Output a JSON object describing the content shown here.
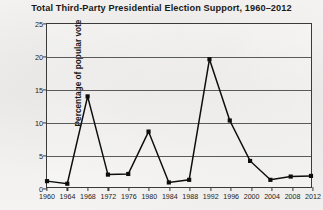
{
  "chart_data": {
    "type": "line",
    "title": "Total Third-Party Presidential Election Support, 1960–2012",
    "xlabel": "",
    "ylabel": "Percentage of popular vote",
    "x": [
      1960,
      1964,
      1968,
      1972,
      1976,
      1980,
      1984,
      1988,
      1992,
      1996,
      2000,
      2004,
      2008,
      2012
    ],
    "categories": [
      "1960",
      "1964",
      "1968",
      "1972",
      "1976",
      "1980",
      "1984",
      "1988",
      "1992",
      "1996",
      "2000",
      "2004",
      "2008",
      "2012"
    ],
    "values": [
      0.9,
      0.5,
      13.9,
      1.9,
      2.0,
      8.5,
      0.7,
      1.1,
      19.6,
      10.2,
      4.0,
      1.1,
      1.6,
      1.7
    ],
    "ylim": [
      0,
      25
    ],
    "yticks": [
      0,
      5,
      10,
      15,
      20,
      25
    ],
    "ytick_labels": [
      "0",
      "5",
      "10",
      "15",
      "20",
      "25"
    ],
    "xlim": [
      1960,
      2012
    ],
    "grid": "horizontal",
    "legend": "none",
    "series_name": "Third-party popular vote share",
    "marker": "square",
    "line_color": "#0d0d0d",
    "marker_color": "#0d0d0d",
    "grid_color": "#5a5a5a",
    "background_color": "#f2f1ef"
  }
}
